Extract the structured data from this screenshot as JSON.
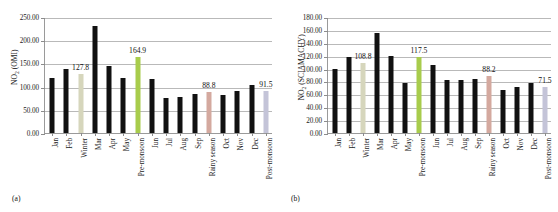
{
  "figure": {
    "background": "#ffffff",
    "width": 558,
    "height": 212
  },
  "panels": [
    {
      "caption": "(a)",
      "chart_data": {
        "type": "bar",
        "title": "",
        "xlabel": "",
        "ylabel": "NO2 (OMI)",
        "ylabel_base": "NO",
        "ylabel_sub": "2",
        "ylabel_rest": " (OMI)",
        "ylim": [
          0,
          250
        ],
        "ytick_step": 50,
        "ytick_labels": [
          "0.00",
          "50.00",
          "100.00",
          "150.00",
          "200.00",
          "250.00"
        ],
        "ytick_values": [
          0,
          50,
          100,
          150,
          200,
          250
        ],
        "grid": true,
        "legend": "none",
        "categories": [
          "Jan",
          "Feb",
          "Winter",
          "Mar",
          "Apr",
          "May",
          "Pre-monsoon",
          "Jun",
          "Jul",
          "Aug",
          "Sep",
          "Rainy season",
          "Oct",
          "Nov",
          "Dec",
          "Post-monsoon"
        ],
        "values": [
          118.0,
          137.0,
          127.8,
          231.0,
          144.0,
          118.0,
          164.9,
          117.0,
          76.0,
          77.0,
          85.0,
          88.8,
          81.0,
          91.0,
          104.0,
          91.5
        ],
        "bar_colors": [
          "#111111",
          "#111111",
          "#d6d6bc",
          "#111111",
          "#111111",
          "#111111",
          "#a8cc4c",
          "#111111",
          "#111111",
          "#111111",
          "#111111",
          "#d4a99f",
          "#111111",
          "#111111",
          "#111111",
          "#c4c4d8"
        ],
        "annotations": [
          {
            "category": "Winter",
            "text": "127.8"
          },
          {
            "category": "Pre-monsoon",
            "text": "164.9"
          },
          {
            "category": "Rainy season",
            "text": "88.8"
          },
          {
            "category": "Post-monsoon",
            "text": "91.5"
          }
        ]
      }
    },
    {
      "caption": "(b)",
      "chart_data": {
        "type": "bar",
        "title": "",
        "xlabel": "",
        "ylabel": "NO2 (SCIAMACHY)",
        "ylabel_base": "NO",
        "ylabel_sub": "2",
        "ylabel_rest": " (SCIAMACHY)",
        "ylim": [
          0,
          180
        ],
        "ytick_step": 20,
        "ytick_labels": [
          "0.00",
          "20.00",
          "40.00",
          "60.00",
          "80.00",
          "100.00",
          "120.00",
          "140.00",
          "160.00",
          "180.00"
        ],
        "ytick_values": [
          0,
          20,
          40,
          60,
          80,
          100,
          120,
          140,
          160,
          180
        ],
        "grid": true,
        "legend": "none",
        "categories": [
          "Jan",
          "Feb",
          "Winter",
          "Mar",
          "Apr",
          "May",
          "Pre-monsoon",
          "Jun",
          "Jul",
          "Aug",
          "Sep",
          "Rainy season",
          "Oct",
          "Nov",
          "Dec",
          "Post-monsoon"
        ],
        "values": [
          99.0,
          118.0,
          108.8,
          155.0,
          120.0,
          77.0,
          117.5,
          105.0,
          82.0,
          82.0,
          84.0,
          88.2,
          66.0,
          72.0,
          78.0,
          71.5
        ],
        "bar_colors": [
          "#111111",
          "#111111",
          "#d6d6bc",
          "#111111",
          "#111111",
          "#111111",
          "#a8cc4c",
          "#111111",
          "#111111",
          "#111111",
          "#111111",
          "#d4a99f",
          "#111111",
          "#111111",
          "#111111",
          "#c4c4d8"
        ],
        "annotations": [
          {
            "category": "Winter",
            "text": "108.8"
          },
          {
            "category": "Pre-monsoon",
            "text": "117.5"
          },
          {
            "category": "Rainy season",
            "text": "88.2"
          },
          {
            "category": "Post-monsoon",
            "text": "71.5"
          }
        ]
      }
    }
  ]
}
